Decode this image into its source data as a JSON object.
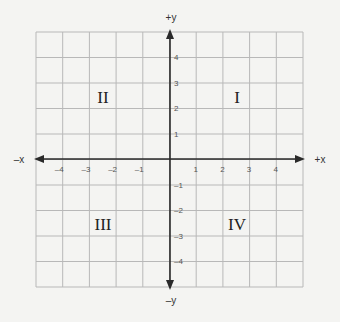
{
  "diagram": {
    "type": "coordinate-plane",
    "grid": {
      "left": 36,
      "top": 32,
      "right": 303,
      "bottom": 287,
      "cols": 10,
      "rows": 10,
      "line_color": "#b8b8b8",
      "axis_color": "#2a2a2a"
    },
    "origin_px": {
      "x": 170,
      "y": 159
    },
    "axes": {
      "x_positive_label": "+x",
      "x_negative_label": "–x",
      "y_positive_label": "+y",
      "y_negative_label": "–y"
    },
    "x_ticks": [
      "–4",
      "–3",
      "–2",
      "–1",
      "1",
      "2",
      "3",
      "4"
    ],
    "x_tick_values": [
      -4,
      -3,
      -2,
      -1,
      1,
      2,
      3,
      4
    ],
    "y_ticks": [
      "4",
      "3",
      "2",
      "1",
      "–1",
      "–2",
      "–3",
      "–4"
    ],
    "y_tick_values": [
      4,
      3,
      2,
      1,
      -1,
      -2,
      -3,
      -4
    ],
    "quadrants": [
      {
        "label": "I",
        "x": 237,
        "y": 103
      },
      {
        "label": "II",
        "x": 103,
        "y": 103
      },
      {
        "label": "III",
        "x": 103,
        "y": 230
      },
      {
        "label": "IV",
        "x": 237,
        "y": 230
      }
    ]
  }
}
